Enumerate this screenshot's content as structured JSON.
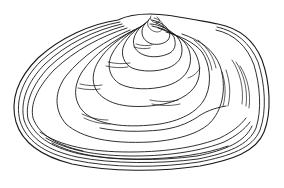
{
  "illustration": {
    "subject": "bivalve shell (freshwater mussel) line drawing",
    "background": "#ffffff",
    "ink": "#1a1a1a"
  }
}
